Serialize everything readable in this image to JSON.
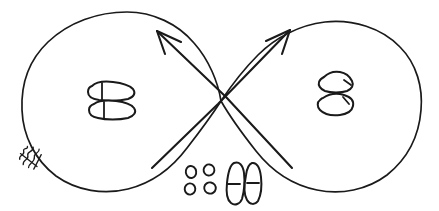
{
  "figure": {
    "title": "Figure-eight footwork path diagram",
    "description": "Hand-drawn infinity / figure-eight loop with crossing directional arrows and footprint step markings",
    "background_color": "#ffffff",
    "ink_color": "#1a1a1a",
    "canvas": {
      "width": 439,
      "height": 211
    }
  },
  "loops": [
    {
      "name": "left-loop",
      "label": "Left loop",
      "center_x": 108,
      "center_y": 101,
      "radius_x": 87,
      "radius_y": 89
    },
    {
      "name": "right-loop",
      "label": "Right loop",
      "center_x": 333,
      "center_y": 101,
      "radius_x": 88,
      "radius_y": 88
    }
  ],
  "crossing_point": {
    "x": 221,
    "y": 101
  },
  "arrows": [
    {
      "name": "arrow-up-left",
      "label": "Travel direction into left loop",
      "from_x": 292,
      "from_y": 168,
      "to_x": 157,
      "to_y": 31,
      "direction": "up-left"
    },
    {
      "name": "arrow-up-right",
      "label": "Travel direction into right loop",
      "from_x": 152,
      "from_y": 168,
      "to_x": 290,
      "to_y": 30,
      "direction": "up-right"
    }
  ],
  "footprint_groups": [
    {
      "name": "left-loop-footprints",
      "label": "Footprints in left loop",
      "orientation": "horizontal",
      "count": 2,
      "center_x": 110,
      "center_y": 101
    },
    {
      "name": "right-loop-footprints",
      "label": "Footprints in right loop",
      "orientation": "angled",
      "count": 2,
      "center_x": 334,
      "center_y": 94
    },
    {
      "name": "center-bottom-footprints",
      "label": "Starting position footprints",
      "orientation": "vertical",
      "count": 2,
      "center_x": 242,
      "center_y": 182
    }
  ],
  "toe_dots": {
    "name": "toe-dot-cluster",
    "label": "Four small toe marks",
    "count": 4,
    "positions": [
      {
        "x": 191,
        "y": 172
      },
      {
        "x": 209,
        "y": 170
      },
      {
        "x": 190,
        "y": 189
      },
      {
        "x": 210,
        "y": 188
      }
    ]
  },
  "annotation": {
    "name": "margin-annotation",
    "label": "Illegible handwritten note along lower-left loop edge",
    "text": "",
    "x": 30,
    "y": 156,
    "rotation_deg": -52
  }
}
